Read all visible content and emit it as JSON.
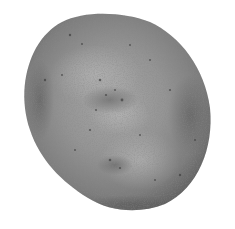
{
  "scene": {
    "subject": "stone",
    "background_color": "#ffffff",
    "stone": {
      "base_color": "#8c8c8c",
      "highlight_color": "#ababab",
      "shadow_color": "#5e5e5e",
      "speckle_color": "#3f3f3f"
    }
  }
}
